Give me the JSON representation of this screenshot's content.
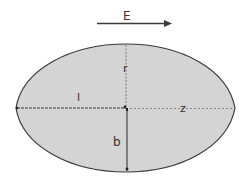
{
  "diagram": {
    "field_label": "E",
    "labels": {
      "r": "r",
      "l": "l",
      "z": "z",
      "b": "b"
    },
    "colors": {
      "fill": "#d4d4d4",
      "stroke": "#3a3a3a",
      "text": "#333333",
      "arrow": "#3a3a3a"
    }
  }
}
